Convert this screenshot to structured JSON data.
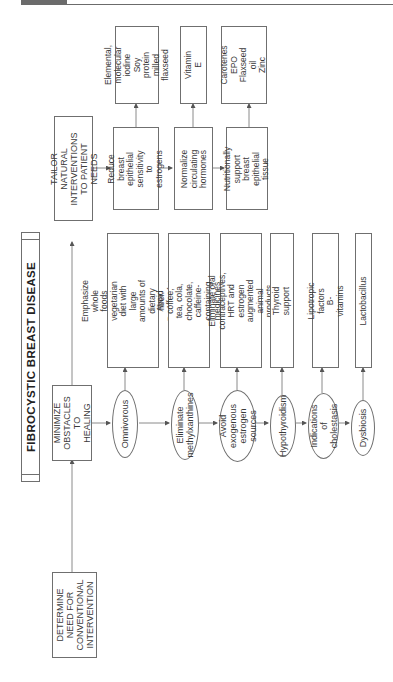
{
  "title": "FIBROCYSTIC BREAST DISEASE",
  "main_steps": [
    {
      "id": "determine",
      "label": "DETERMINE\nNEED FOR\nCONVENTIONAL\nINTERVENTION"
    },
    {
      "id": "minimize",
      "label": "MINIMIZE\nOBSTACLES\nTO HEALING"
    },
    {
      "id": "tailor",
      "label": "TAILOR NATURAL\nINTERVENTIONS\nTO PATIENT NEEDS"
    }
  ],
  "obstacles": [
    {
      "condition": "Omnivorous",
      "action": "Emphasize whole foods\nvegetarian diet with large\namounts of dietary fiber.\nReduce fat to 15%."
    },
    {
      "condition": "Eliminate\nmethylxanthines",
      "action": "Avoid coffee, tea, cola,\nchocolate, caffeine-containing\nmedicines"
    },
    {
      "condition": "Avoid exogenous\nestrogen sources",
      "action": "Eliminate oral contraceptives,\nHRT and estrogen\naugmented animal products"
    },
    {
      "condition": "Hypothyroidism",
      "action": "Thyroid support"
    },
    {
      "condition": "Indications\nof cholestasis",
      "action": "Lipotropic factors\nB-vitamins"
    },
    {
      "condition": "Dysbiosis",
      "action": "Lactobacillus"
    }
  ],
  "interventions": [
    {
      "goal": "Reduce breast\nepithelial\nsensitivity to\nestrogens",
      "agents": "Elemental,\nmolecular iodine\nSoy protein\nmilled flaxseed"
    },
    {
      "goal": "Normalize\ncirculating\nhormones",
      "agents": "Vitamin E"
    },
    {
      "goal": "Nutritionally\nsupport breast\nepithelial tissue",
      "agents": "Carotenes\nEPO\nFlaxseed oil\nZinc"
    }
  ],
  "colors": {
    "line": "#6f6f6f",
    "text": "#3a3a3a",
    "header_bar": "#6b6b6b"
  }
}
